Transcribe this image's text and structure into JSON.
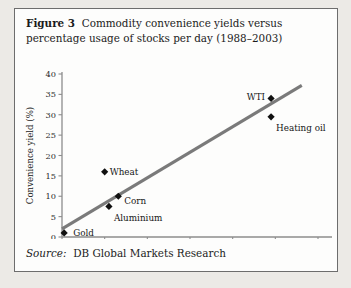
{
  "figure": {
    "number_label": "Figure 3",
    "caption": "Commodity convenience yields versus percentage usage of stocks per day (1988–2003)",
    "source_label": "Source:",
    "source_value": "DB Global Markets Research"
  },
  "colors": {
    "border": "#6d6d6d",
    "panel_background": "#fdfdfc",
    "page_background": "#eceae6",
    "axis": "#8d8d8d",
    "trendline": "#7a7a7a",
    "marker": "#101010",
    "text": "#1b1b1b"
  },
  "chart_data": {
    "type": "scatter",
    "title": "Commodity convenience yields versus percentage usage of stocks per day (1988–2003)",
    "xlabel": "Daily consumption/stocks (%/day)",
    "ylabel": "Convenience yield (%)",
    "xlim": [
      0,
      6
    ],
    "ylim": [
      0,
      40
    ],
    "xticks": [
      "0",
      "1",
      "2",
      "3",
      "4",
      "5",
      "6"
    ],
    "yticks": [
      "0",
      "5",
      "10",
      "15",
      "20",
      "25",
      "30",
      "35",
      "40"
    ],
    "grid": false,
    "legend": "none",
    "points": [
      {
        "label": "Gold",
        "x": 0.05,
        "y": 1.0,
        "label_dx": 9,
        "label_dy": 3.5,
        "anchor": "start"
      },
      {
        "label": "Aluminium",
        "x": 1.1,
        "y": 7.5,
        "label_dx": 5,
        "label_dy": 15,
        "anchor": "start"
      },
      {
        "label": "Wheat",
        "x": 1.0,
        "y": 16.0,
        "label_dx": 5,
        "label_dy": 3.5,
        "anchor": "start"
      },
      {
        "label": "Corn",
        "x": 1.32,
        "y": 10.0,
        "label_dx": 6,
        "label_dy": 8,
        "anchor": "start"
      },
      {
        "label": "Heating oil",
        "x": 4.9,
        "y": 29.5,
        "label_dx": 5,
        "label_dy": 14,
        "anchor": "start"
      },
      {
        "label": "WTI",
        "x": 4.9,
        "y": 34.0,
        "label_dx": -6,
        "label_dy": 2,
        "anchor": "end"
      }
    ],
    "trendline": {
      "x0": 0.0,
      "y0": 2.0,
      "x1": 5.62,
      "y1": 37.2
    }
  }
}
